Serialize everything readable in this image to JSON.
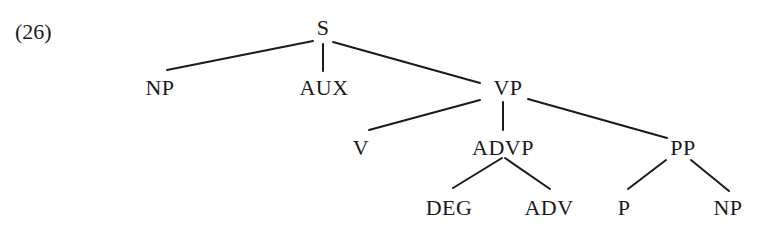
{
  "example_number": "(26)",
  "tree": {
    "nodes": [
      {
        "id": "S",
        "label": "S",
        "x": 323,
        "y": 28
      },
      {
        "id": "NP1",
        "label": "NP",
        "x": 160,
        "y": 88
      },
      {
        "id": "AUX",
        "label": "AUX",
        "x": 324,
        "y": 88
      },
      {
        "id": "VP",
        "label": "VP",
        "x": 508,
        "y": 88
      },
      {
        "id": "V",
        "label": "V",
        "x": 361,
        "y": 148
      },
      {
        "id": "ADVP",
        "label": "ADVP",
        "x": 503,
        "y": 148
      },
      {
        "id": "PP",
        "label": "PP",
        "x": 683,
        "y": 148
      },
      {
        "id": "DEG",
        "label": "DEG",
        "x": 449,
        "y": 208
      },
      {
        "id": "ADV",
        "label": "ADV",
        "x": 549,
        "y": 208
      },
      {
        "id": "P",
        "label": "P",
        "x": 624,
        "y": 208
      },
      {
        "id": "NP2",
        "label": "NP",
        "x": 728,
        "y": 208
      }
    ],
    "edges": [
      {
        "from": "S",
        "to": "NP1",
        "x1": 313,
        "y1": 41,
        "x2": 167,
        "y2": 70
      },
      {
        "from": "S",
        "to": "AUX",
        "x1": 323,
        "y1": 44,
        "x2": 323,
        "y2": 71
      },
      {
        "from": "S",
        "to": "VP",
        "x1": 333,
        "y1": 42,
        "x2": 480,
        "y2": 83
      },
      {
        "from": "VP",
        "to": "V",
        "x1": 480,
        "y1": 100,
        "x2": 369,
        "y2": 130
      },
      {
        "from": "VP",
        "to": "ADVP",
        "x1": 503,
        "y1": 102,
        "x2": 503,
        "y2": 130
      },
      {
        "from": "VP",
        "to": "PP",
        "x1": 528,
        "y1": 99,
        "x2": 667,
        "y2": 138
      },
      {
        "from": "ADVP",
        "to": "DEG",
        "x1": 502,
        "y1": 158,
        "x2": 453,
        "y2": 188
      },
      {
        "from": "ADVP",
        "to": "ADV",
        "x1": 505,
        "y1": 158,
        "x2": 550,
        "y2": 189
      },
      {
        "from": "PP",
        "to": "P",
        "x1": 666,
        "y1": 160,
        "x2": 628,
        "y2": 189
      },
      {
        "from": "PP",
        "to": "NP2",
        "x1": 691,
        "y1": 160,
        "x2": 729,
        "y2": 191
      }
    ]
  }
}
